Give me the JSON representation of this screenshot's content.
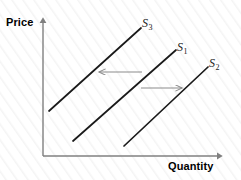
{
  "figure": {
    "type": "economics-supply-shift-diagram",
    "background_color": "#ffffff",
    "texture": "faint diagonal hatch"
  },
  "axes": {
    "y_label": "Price",
    "x_label": "Quantity",
    "axis_color": "#808080",
    "origin": {
      "x": 43,
      "y": 156
    },
    "y_axis_top": {
      "x": 43,
      "y": 18
    },
    "x_axis_right": {
      "x": 222,
      "y": 156
    }
  },
  "curves": [
    {
      "id": "s3",
      "label": "S",
      "subscript": "3",
      "color": "#1a1a1a",
      "start": {
        "x": 49,
        "y": 111
      },
      "end": {
        "x": 141,
        "y": 28
      }
    },
    {
      "id": "s1",
      "label": "S",
      "subscript": "1",
      "color": "#1a1a1a",
      "start": {
        "x": 73,
        "y": 141
      },
      "end": {
        "x": 176,
        "y": 50
      }
    },
    {
      "id": "s2",
      "label": "S",
      "subscript": "2",
      "color": "#1a1a1a",
      "start": {
        "x": 124,
        "y": 146
      },
      "end": {
        "x": 208,
        "y": 67
      }
    }
  ],
  "shift_arrows": [
    {
      "id": "leftward-shift-arrow",
      "direction": "left",
      "color": "#8c8c8c",
      "from": {
        "x": 142,
        "y": 72
      },
      "to": {
        "x": 97,
        "y": 72
      }
    },
    {
      "id": "rightward-shift-arrow",
      "direction": "right",
      "color": "#8c8c8c",
      "from": {
        "x": 141,
        "y": 88
      },
      "to": {
        "x": 184,
        "y": 88
      }
    }
  ]
}
